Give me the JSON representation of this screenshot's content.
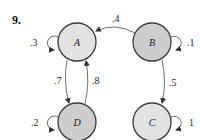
{
  "problem": {
    "number": "9."
  },
  "nodes": [
    {
      "id": "A",
      "label": "A",
      "shade": "light",
      "cx": 77,
      "cy": 42
    },
    {
      "id": "B",
      "label": "B",
      "shade": "dark",
      "cx": 152,
      "cy": 42
    },
    {
      "id": "C",
      "label": "C",
      "shade": "light",
      "cx": 152,
      "cy": 122
    },
    {
      "id": "D",
      "label": "D",
      "shade": "dark",
      "cx": 77,
      "cy": 122
    }
  ],
  "edges": [
    {
      "from": "B",
      "to": "A",
      "weight": ".4"
    },
    {
      "from": "A",
      "to": "D",
      "weight": ".7"
    },
    {
      "from": "D",
      "to": "A",
      "weight": ".8"
    },
    {
      "from": "B",
      "to": "C",
      "weight": ".5"
    }
  ],
  "self_loops": [
    {
      "node": "A",
      "weight": ".3",
      "side": "left"
    },
    {
      "node": "B",
      "weight": ".1",
      "side": "right"
    },
    {
      "node": "D",
      "weight": ".2",
      "side": "left"
    },
    {
      "node": "C",
      "weight": "1",
      "side": "right"
    }
  ],
  "colors": {
    "light_node": "#e2e2e2",
    "dark_node": "#cdcdcd",
    "stroke": "#3a3a3a"
  }
}
